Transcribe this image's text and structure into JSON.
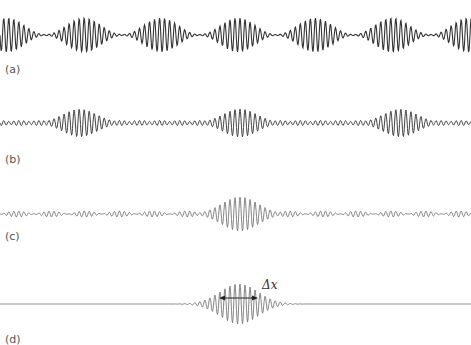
{
  "figure": {
    "panels": [
      {
        "id": "a",
        "label": "(a)",
        "center_y": 35,
        "label_x": 5,
        "label_y": 63,
        "kind": "periodic",
        "k": 1.25,
        "packet_period": 77,
        "packet_offset": 7,
        "amplitude": 17,
        "min_amp": 0.5,
        "stroke": "#333333",
        "width": 1.1
      },
      {
        "id": "b",
        "label": "(b)",
        "center_y": 123,
        "label_x": 5,
        "label_y": 153,
        "kind": "periodic_sharp",
        "k": 1.25,
        "packet_period": 160,
        "packet_offset": 80,
        "amplitude": 14,
        "min_amp": 2.5,
        "stroke": "#444444",
        "width": 1.0
      },
      {
        "id": "c",
        "label": "(c)",
        "center_y": 214,
        "label_x": 5,
        "label_y": 230,
        "kind": "single_with_ripple",
        "k": 1.25,
        "packet_center": 240,
        "packet_sigma": 18,
        "amplitude": 17,
        "ripple_amp": 3,
        "ripple_period": 34,
        "stroke": "#777777",
        "width": 0.9
      },
      {
        "id": "d",
        "label": "(d)",
        "center_y": 304,
        "label_x": 5,
        "label_y": 333,
        "kind": "single",
        "k": 1.25,
        "packet_center": 239,
        "packet_sigma": 19,
        "amplitude": 20,
        "stroke": "#777777",
        "width": 0.9
      }
    ],
    "annotation": {
      "symbol": "Δx",
      "arrow": {
        "x1": 219,
        "x2": 258,
        "y": 298
      },
      "label_x": 262,
      "label_y": 278
    }
  },
  "chart_data": {
    "type": "line",
    "title": "",
    "series": [
      {
        "name": "(a)",
        "pattern": "regular beats, packet spacing ~77px"
      },
      {
        "name": "(b)",
        "pattern": "packets spacing ~160px with small ripples between"
      },
      {
        "name": "(c)",
        "pattern": "single large packet at center with small ripples elsewhere"
      },
      {
        "name": "(d)",
        "pattern": "single localized packet, flat elsewhere"
      }
    ],
    "annotations": [
      "Δx"
    ],
    "xlabel": "",
    "ylabel": ""
  }
}
